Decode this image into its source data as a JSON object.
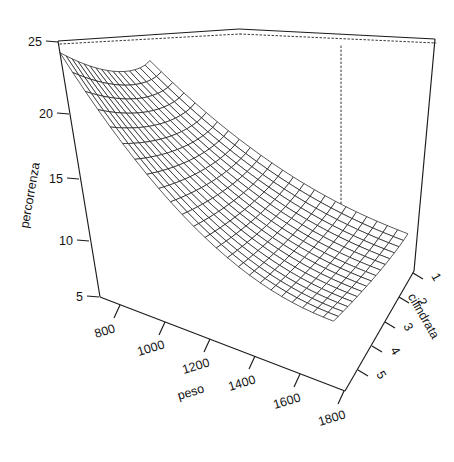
{
  "figure": {
    "kind": "persp-3d-surface",
    "background_color": "#ffffff",
    "line_color": "#1a1a1a",
    "box_style": "solid-front dotted-hidden"
  },
  "axes": {
    "x": {
      "name": "peso",
      "label": "peso",
      "ticks": [
        "800",
        "1000",
        "1200",
        "1400",
        "1600",
        "1800"
      ],
      "tick_values": [
        800,
        1000,
        1200,
        1400,
        1600,
        1800
      ],
      "range": [
        700,
        1900
      ]
    },
    "y": {
      "name": "cilindrata",
      "label": "cilindrata",
      "ticks": [
        "1",
        "2",
        "3",
        "4",
        "5"
      ],
      "tick_values": [
        1,
        2,
        3,
        4,
        5
      ],
      "range": [
        0.7,
        5.4
      ]
    },
    "z": {
      "name": "percorrenza",
      "label": "percorrenza",
      "ticks": [
        "5",
        "10",
        "15",
        "20",
        "25"
      ],
      "tick_values": [
        5,
        10,
        15,
        20,
        25
      ],
      "range": [
        4,
        26
      ]
    }
  },
  "chart_data": {
    "type": "surface",
    "title": "",
    "xlabel": "peso",
    "ylabel": "cilindrata",
    "zlabel": "percorrenza",
    "xlim": [
      700,
      1900
    ],
    "ylim": [
      0.7,
      5.4
    ],
    "zlim": [
      4,
      26
    ],
    "grid": false,
    "legend": "none",
    "x": [
      700,
      750,
      800,
      850,
      900,
      950,
      1000,
      1050,
      1100,
      1150,
      1200,
      1250,
      1300,
      1350,
      1400,
      1450,
      1500,
      1550,
      1600,
      1650,
      1700,
      1750,
      1800,
      1850,
      1900
    ],
    "y": [
      0.7,
      1.0,
      1.3,
      1.6,
      1.9,
      2.2,
      2.5,
      2.8,
      3.1,
      3.4,
      3.7,
      4.0,
      4.3,
      4.6,
      4.9,
      5.2,
      5.4
    ],
    "z_description": "percorrenza decays steeply with increasing peso and with increasing cilindrata; maximum near low peso / low cilindrata, flat plateau at high peso",
    "z_corner_values": {
      "min_peso_min_cilindrata": 25.0,
      "min_peso_max_cilindrata": 14.0,
      "max_peso_min_cilindrata": 10.0,
      "max_peso_max_cilindrata": 7.2
    },
    "mesh_divisions": {
      "x": 24,
      "y": 16
    }
  },
  "annotations": {
    "x_tick_labels": [
      "800",
      "1000",
      "1200",
      "1400",
      "1600",
      "1800"
    ],
    "y_tick_labels": [
      "1",
      "2",
      "3",
      "4",
      "5"
    ],
    "z_tick_labels": [
      "5",
      "10",
      "15",
      "20",
      "25"
    ]
  }
}
